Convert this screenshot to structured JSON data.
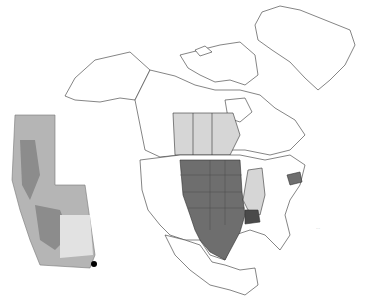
{
  "map": {
    "type": "choropleth distribution map",
    "region": "North America",
    "inset_region": "Alberta",
    "colors": {
      "background": "#ffffff",
      "outline": "#333333",
      "primary_range": "#6e6e6e",
      "secondary_range": "#d6d6d6",
      "dark_state": "#4a4a4a",
      "inset_fill": "#b5b5b5",
      "inset_dark": "#8c8c8c",
      "inset_light": "#e2e2e2",
      "point_marker": "#000000"
    },
    "shaded_regions_primary": [
      "Montana",
      "Wyoming",
      "North Dakota",
      "South Dakota",
      "Nebraska",
      "Kansas",
      "Colorado",
      "New Mexico",
      "Texas",
      "Oklahoma",
      "Minnesota",
      "Iowa",
      "New York"
    ],
    "shaded_regions_dark": [
      "Arkansas"
    ],
    "shaded_regions_secondary": [
      "Alberta",
      "Saskatchewan",
      "Manitoba",
      "Wisconsin",
      "Illinois",
      "Missouri"
    ],
    "scale_label": "···"
  }
}
